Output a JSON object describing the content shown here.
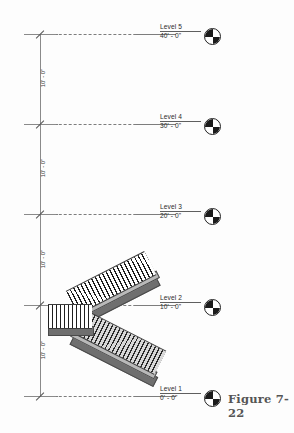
{
  "figure": {
    "caption": "Figure 7-22"
  },
  "levels": [
    {
      "name": "Level 5",
      "elevation": "40' - 0\"",
      "y": 34
    },
    {
      "name": "Level 4",
      "elevation": "30' - 0\"",
      "y": 124
    },
    {
      "name": "Level 3",
      "elevation": "20' - 0\"",
      "y": 214
    },
    {
      "name": "Level 2",
      "elevation": "10' - 0\"",
      "y": 305
    },
    {
      "name": "Level 1",
      "elevation": "0' - 0\"",
      "y": 396
    }
  ],
  "dimensions": [
    {
      "text": "10' - 0\"",
      "top": 34,
      "bottom": 124
    },
    {
      "text": "10' - 0\"",
      "top": 124,
      "bottom": 214
    },
    {
      "text": "10' - 0\"",
      "top": 214,
      "bottom": 305
    },
    {
      "text": "10' - 0\"",
      "top": 305,
      "bottom": 396
    }
  ],
  "stair": {
    "label": "multistory-stair-elevation",
    "flights": [
      {
        "name": "upper-flight",
        "direction": "up-right",
        "from_level": "Level 1",
        "to_level": "Level 2"
      },
      {
        "name": "lower-flight",
        "direction": "down-right",
        "from_level": "Level 2",
        "to_level": "Level 1"
      }
    ],
    "component_names": [
      "railing-balusters",
      "stair-stringer",
      "tread-run"
    ]
  },
  "colors": {
    "datum_line": "#7d7d7d",
    "dimension_line": "#8a8a8a",
    "text": "#2b2b2b",
    "bubble_fill": "#1b1b1b",
    "stair_slab": "#8e8e8e",
    "stair_slab_dark": "#6f6f6f",
    "stair_slab_light": "#b9b9b9",
    "caption": "#555555"
  }
}
